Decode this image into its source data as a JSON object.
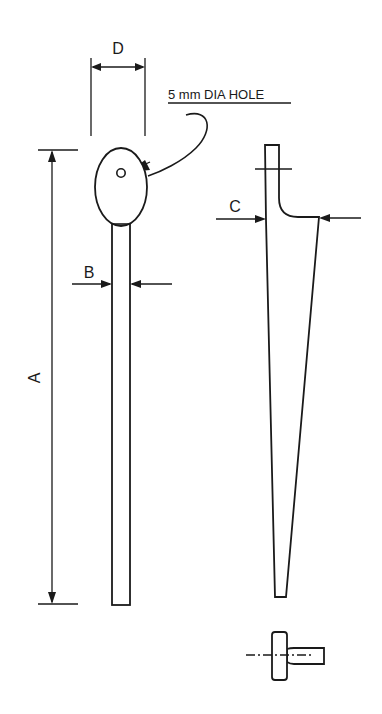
{
  "drawing": {
    "type": "technical-drawing",
    "background": "#ffffff",
    "line_color": "#1a1a1a",
    "views": [
      {
        "name": "front-view",
        "description": "Spoon-shaped probe: oval head with hole on top of a long narrow shaft"
      },
      {
        "name": "side-view",
        "description": "Tapered profile with a short upright tab and filleted ledge"
      },
      {
        "name": "end-view",
        "description": "Small section showing disc and stem with dash-dot centerline"
      }
    ],
    "dimensions": {
      "A": {
        "label": "A",
        "meaning": "overall length",
        "orientation": "vertical"
      },
      "B": {
        "label": "B",
        "meaning": "shaft width",
        "orientation": "horizontal"
      },
      "C": {
        "label": "C",
        "meaning": "ledge depth",
        "orientation": "horizontal"
      },
      "D": {
        "label": "D",
        "meaning": "head width",
        "orientation": "horizontal"
      }
    },
    "annotations": {
      "hole_note": "5 mm DIA HOLE"
    }
  }
}
